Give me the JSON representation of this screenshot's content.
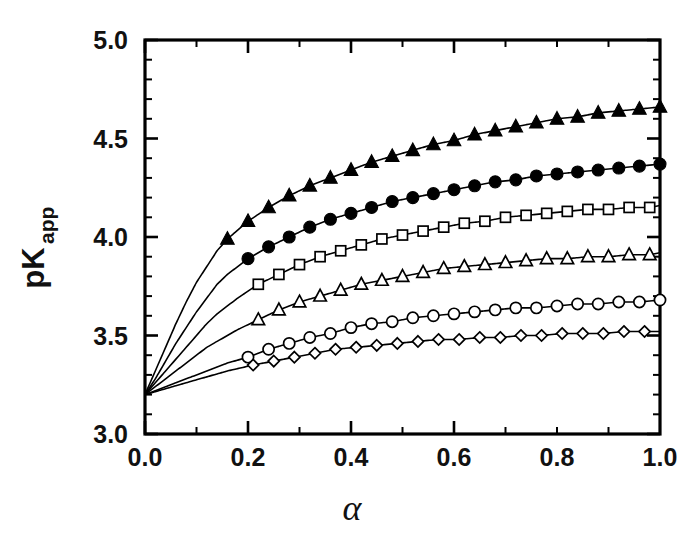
{
  "chart_data": {
    "type": "line",
    "title": "",
    "xlabel": "α",
    "ylabel": "pK",
    "ylabel_sub": "app",
    "xlim": [
      0.0,
      1.0
    ],
    "ylim": [
      3.0,
      5.0
    ],
    "grid": false,
    "legend": "none",
    "xticks": [
      0.0,
      0.2,
      0.4,
      0.6,
      0.8,
      1.0
    ],
    "xticklabels": [
      "0.0",
      "0.2",
      "0.4",
      "0.6",
      "0.8",
      "1.0"
    ],
    "xminor_step": 0.1,
    "yticks": [
      3.0,
      3.5,
      4.0,
      4.5,
      5.0
    ],
    "yticklabels": [
      "3.0",
      "3.5",
      "4.0",
      "4.5",
      "5.0"
    ],
    "yminor_step": 0.1,
    "common_origin": {
      "x": 0.0,
      "y": 3.2
    },
    "series": [
      {
        "name": "series-1",
        "marker": "filled-triangle",
        "marker_first_x": 0.16,
        "marker_step": 0.04,
        "x": [
          0.0,
          0.02,
          0.04,
          0.06,
          0.08,
          0.1,
          0.12,
          0.14,
          0.16,
          0.2,
          0.24,
          0.28,
          0.32,
          0.36,
          0.4,
          0.44,
          0.48,
          0.52,
          0.56,
          0.6,
          0.64,
          0.68,
          0.72,
          0.76,
          0.8,
          0.84,
          0.88,
          0.92,
          0.96,
          1.0
        ],
        "y": [
          3.2,
          3.32,
          3.44,
          3.56,
          3.67,
          3.77,
          3.85,
          3.93,
          3.99,
          4.08,
          4.15,
          4.21,
          4.26,
          4.3,
          4.34,
          4.38,
          4.41,
          4.44,
          4.47,
          4.49,
          4.52,
          4.54,
          4.56,
          4.58,
          4.6,
          4.61,
          4.63,
          4.64,
          4.65,
          4.66
        ]
      },
      {
        "name": "series-2",
        "marker": "filled-circle",
        "marker_first_x": 0.2,
        "marker_step": 0.04,
        "x": [
          0.0,
          0.02,
          0.04,
          0.06,
          0.08,
          0.1,
          0.12,
          0.14,
          0.16,
          0.2,
          0.24,
          0.28,
          0.32,
          0.36,
          0.4,
          0.44,
          0.48,
          0.52,
          0.56,
          0.6,
          0.64,
          0.68,
          0.72,
          0.76,
          0.8,
          0.84,
          0.88,
          0.92,
          0.96,
          1.0
        ],
        "y": [
          3.2,
          3.28,
          3.37,
          3.46,
          3.54,
          3.62,
          3.69,
          3.76,
          3.81,
          3.89,
          3.95,
          4.0,
          4.05,
          4.09,
          4.12,
          4.15,
          4.18,
          4.2,
          4.22,
          4.24,
          4.26,
          4.28,
          4.29,
          4.31,
          4.32,
          4.33,
          4.34,
          4.35,
          4.36,
          4.37
        ]
      },
      {
        "name": "series-3",
        "marker": "open-square",
        "marker_first_x": 0.22,
        "marker_step": 0.04,
        "x": [
          0.0,
          0.02,
          0.04,
          0.06,
          0.08,
          0.1,
          0.12,
          0.14,
          0.18,
          0.22,
          0.26,
          0.3,
          0.34,
          0.38,
          0.42,
          0.46,
          0.5,
          0.54,
          0.58,
          0.62,
          0.66,
          0.7,
          0.74,
          0.78,
          0.82,
          0.86,
          0.9,
          0.94,
          0.98,
          1.0
        ],
        "y": [
          3.2,
          3.26,
          3.32,
          3.38,
          3.44,
          3.5,
          3.56,
          3.61,
          3.69,
          3.76,
          3.81,
          3.86,
          3.9,
          3.93,
          3.96,
          3.99,
          4.01,
          4.03,
          4.05,
          4.07,
          4.08,
          4.1,
          4.11,
          4.12,
          4.13,
          4.14,
          4.14,
          4.15,
          4.15,
          4.16
        ]
      },
      {
        "name": "series-4",
        "marker": "open-triangle",
        "marker_first_x": 0.22,
        "marker_step": 0.04,
        "x": [
          0.0,
          0.02,
          0.04,
          0.06,
          0.08,
          0.1,
          0.12,
          0.14,
          0.18,
          0.22,
          0.26,
          0.3,
          0.34,
          0.38,
          0.42,
          0.46,
          0.5,
          0.54,
          0.58,
          0.62,
          0.66,
          0.7,
          0.74,
          0.78,
          0.82,
          0.86,
          0.9,
          0.94,
          0.98,
          1.0
        ],
        "y": [
          3.2,
          3.24,
          3.28,
          3.32,
          3.36,
          3.4,
          3.44,
          3.47,
          3.53,
          3.58,
          3.63,
          3.67,
          3.7,
          3.73,
          3.76,
          3.78,
          3.8,
          3.82,
          3.84,
          3.85,
          3.86,
          3.87,
          3.88,
          3.89,
          3.89,
          3.9,
          3.9,
          3.91,
          3.91,
          3.92
        ]
      },
      {
        "name": "series-5",
        "marker": "open-circle",
        "marker_first_x": 0.2,
        "marker_step": 0.04,
        "x": [
          0.0,
          0.04,
          0.08,
          0.12,
          0.16,
          0.2,
          0.24,
          0.28,
          0.32,
          0.36,
          0.4,
          0.44,
          0.48,
          0.52,
          0.56,
          0.6,
          0.64,
          0.68,
          0.72,
          0.76,
          0.8,
          0.84,
          0.88,
          0.92,
          0.96,
          1.0
        ],
        "y": [
          3.2,
          3.24,
          3.28,
          3.32,
          3.36,
          3.39,
          3.43,
          3.46,
          3.49,
          3.51,
          3.54,
          3.56,
          3.57,
          3.59,
          3.6,
          3.61,
          3.62,
          3.63,
          3.64,
          3.64,
          3.65,
          3.66,
          3.66,
          3.67,
          3.67,
          3.68
        ]
      },
      {
        "name": "series-6",
        "marker": "open-diamond",
        "marker_first_x": 0.21,
        "marker_step": 0.04,
        "x": [
          0.0,
          0.04,
          0.08,
          0.12,
          0.16,
          0.21,
          0.25,
          0.29,
          0.33,
          0.37,
          0.41,
          0.45,
          0.49,
          0.53,
          0.57,
          0.61,
          0.65,
          0.69,
          0.73,
          0.77,
          0.81,
          0.85,
          0.89,
          0.93,
          0.97,
          1.0
        ],
        "y": [
          3.2,
          3.23,
          3.26,
          3.29,
          3.32,
          3.35,
          3.37,
          3.39,
          3.41,
          3.43,
          3.44,
          3.45,
          3.46,
          3.47,
          3.48,
          3.48,
          3.49,
          3.49,
          3.5,
          3.5,
          3.51,
          3.51,
          3.51,
          3.52,
          3.52,
          3.52
        ]
      }
    ]
  }
}
